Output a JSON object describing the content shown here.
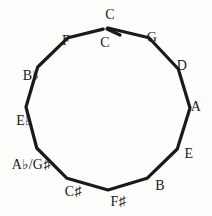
{
  "figure": {
    "shape": "dodecagon",
    "stroke_color": "#1a1a1a",
    "background_color": "#fdfdfc",
    "label_color": "#1a1a1a"
  },
  "chart_data": {
    "type": "diagram",
    "subtitle": "",
    "xlabel": "",
    "ylabel": "",
    "grid": false,
    "legend": "none",
    "shape": "dodecagon",
    "vertex_count": 12,
    "center": [
      108,
      108
    ],
    "radius": 80,
    "direction": "clockwise",
    "start_at": "top",
    "open_at_top": true,
    "categories": [
      "C",
      "G",
      "D",
      "A",
      "E",
      "B",
      "F♯",
      "C♯",
      "A♭/G♯",
      "E♭",
      "B♭",
      "F"
    ],
    "values": [
      0,
      1,
      2,
      3,
      4,
      5,
      6,
      7,
      8,
      9,
      10,
      11
    ],
    "labels": [
      {
        "id": "c-outer",
        "text": "C",
        "base": "C",
        "accidental": "",
        "vertex_index": 0,
        "angle_deg": 0,
        "placement": "outside",
        "x": 110,
        "y": 15
      },
      {
        "id": "c-inner",
        "text": "C",
        "base": "C",
        "accidental": "",
        "vertex_index": 0,
        "angle_deg": 0,
        "placement": "inside",
        "x": 105,
        "y": 43
      },
      {
        "id": "g",
        "text": "G",
        "base": "G",
        "accidental": "",
        "vertex_index": 1,
        "angle_deg": 30,
        "placement": "outside",
        "x": 152,
        "y": 38
      },
      {
        "id": "d",
        "text": "D",
        "base": "D",
        "accidental": "",
        "vertex_index": 2,
        "angle_deg": 60,
        "placement": "outside",
        "x": 182,
        "y": 66
      },
      {
        "id": "a",
        "text": "A",
        "base": "A",
        "accidental": "",
        "vertex_index": 3,
        "angle_deg": 90,
        "placement": "outside",
        "x": 196,
        "y": 107
      },
      {
        "id": "e",
        "text": "E",
        "base": "E",
        "accidental": "",
        "vertex_index": 4,
        "angle_deg": 120,
        "placement": "outside",
        "x": 189,
        "y": 154
      },
      {
        "id": "b",
        "text": "B",
        "base": "B",
        "accidental": "",
        "vertex_index": 5,
        "angle_deg": 150,
        "placement": "outside",
        "x": 160,
        "y": 186
      },
      {
        "id": "f-sharp",
        "text": "F♯",
        "base": "F",
        "accidental": "♯",
        "vertex_index": 6,
        "angle_deg": 180,
        "placement": "outside",
        "x": 118,
        "y": 202
      },
      {
        "id": "c-sharp",
        "text": "C♯",
        "base": "C",
        "accidental": "♯",
        "vertex_index": 7,
        "angle_deg": 210,
        "placement": "outside",
        "x": 73,
        "y": 192
      },
      {
        "id": "a-flat-g-sharp",
        "text": "A♭/G♯",
        "base": "A♭/G",
        "accidental": "♯",
        "vertex_index": 8,
        "angle_deg": 240,
        "placement": "outside",
        "x": 31,
        "y": 165
      },
      {
        "id": "e-flat",
        "text": "E♭",
        "base": "E",
        "accidental": "♭",
        "vertex_index": 9,
        "angle_deg": 270,
        "placement": "outside",
        "x": 24,
        "y": 121
      },
      {
        "id": "b-flat",
        "text": "B♭",
        "base": "B",
        "accidental": "♭",
        "vertex_index": 10,
        "angle_deg": 300,
        "placement": "outside",
        "x": 31,
        "y": 76
      },
      {
        "id": "f",
        "text": "F",
        "base": "F",
        "accidental": "",
        "vertex_index": 11,
        "angle_deg": 330,
        "placement": "outside",
        "x": 66,
        "y": 41
      }
    ]
  }
}
